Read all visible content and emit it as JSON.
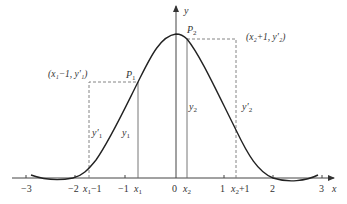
{
  "diagram": {
    "type": "curve-with-annotations",
    "axes": {
      "x_label": "x",
      "y_label": "y",
      "x_ticks": [
        {
          "label": "−3",
          "value": -3
        },
        {
          "label": "−2",
          "value": -2
        },
        {
          "label": "−1",
          "value": -1
        },
        {
          "label": "0",
          "value": 0
        },
        {
          "label": "1",
          "value": 1
        },
        {
          "label": "2",
          "value": 2
        },
        {
          "label": "3",
          "value": 3
        }
      ],
      "special_x_marks": [
        {
          "label_base": "x",
          "label_sub": "1",
          "label_suffix": "−1",
          "name": "x1-minus-1"
        },
        {
          "label_base": "x",
          "label_sub": "1",
          "label_suffix": "",
          "name": "x1"
        },
        {
          "label_base": "x",
          "label_sub": "2",
          "label_suffix": "",
          "name": "x2"
        },
        {
          "label_base": "x",
          "label_sub": "2",
          "label_suffix": "+1",
          "name": "x2-plus-1"
        }
      ]
    },
    "points": {
      "p1": {
        "base": "P",
        "sub": "1"
      },
      "p2": {
        "base": "P",
        "sub": "2"
      }
    },
    "coordinate_labels": {
      "left": "(x₁−1, y′₁)",
      "right": "(x₂+1, y′₂)"
    },
    "segment_labels": {
      "y1_prime": {
        "base": "y′",
        "sub": "1"
      },
      "y1": {
        "base": "y",
        "sub": "1"
      },
      "y2": {
        "base": "y",
        "sub": "2"
      },
      "y2_prime": {
        "base": "y′",
        "sub": "2"
      }
    },
    "colors": {
      "curve": "#222222",
      "axis": "#444444",
      "dashed": "#777777",
      "solid_vertical": "#666666",
      "text": "#333333"
    }
  }
}
